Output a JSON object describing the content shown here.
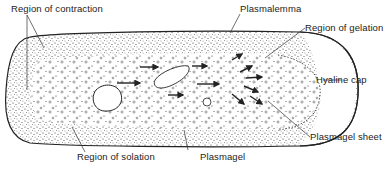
{
  "diagram": {
    "labels": {
      "region_of_contraction": "Region of contraction",
      "plasmalemma": "Plasmalemma",
      "region_of_gelation": "Region of gelation",
      "hyaline_cap": "Hyaline cap",
      "plasmagel_sheet": "Plasmagel sheet",
      "plasmagel": "Plasmagel",
      "region_of_solation": "Region of solation"
    },
    "colors": {
      "ink": "#222222",
      "background": "#ffffff"
    }
  }
}
